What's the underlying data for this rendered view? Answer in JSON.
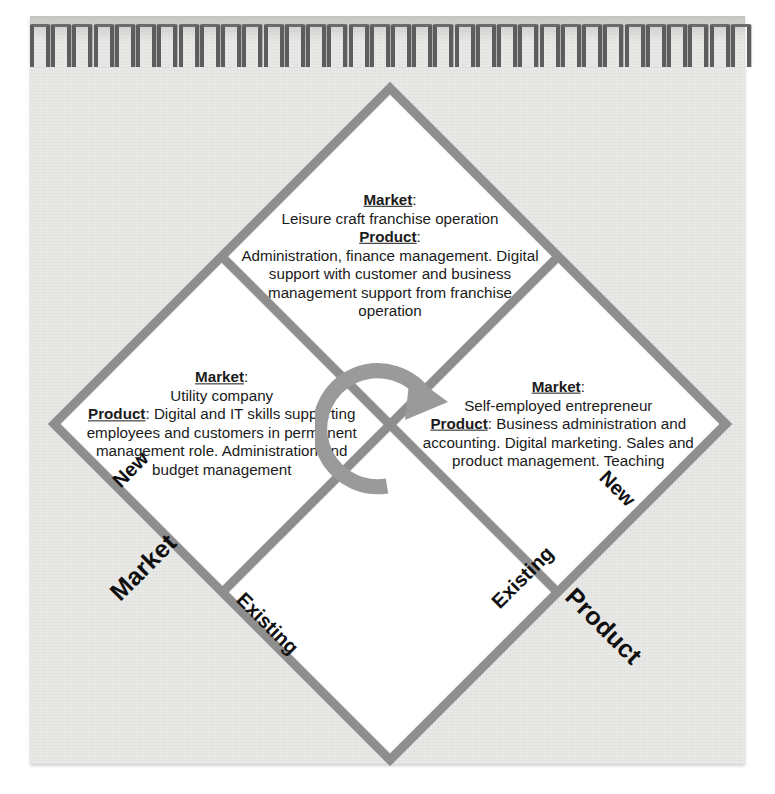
{
  "figure": {
    "type": "ansoff-matrix-diamond",
    "colors": {
      "band": "#8e8e8e",
      "cell": "#ffffff",
      "page": "#e9e9e7",
      "text": "#1b1b1b",
      "coil": "#5d5d5d"
    },
    "binding": {
      "coil_count": 34
    }
  },
  "labels": {
    "market_heading": "Market",
    "product_heading": "Product",
    "colon": ":"
  },
  "axes": {
    "left": {
      "name": "Market",
      "upper": "New",
      "lower": "Existing"
    },
    "right": {
      "name": "Product",
      "upper": "New",
      "lower": "Existing"
    }
  },
  "quadrants": {
    "top": {
      "position": "top",
      "market_label": "Market",
      "market_text": "Self-employed entrepreneur",
      "product_label": "Product",
      "product_text": "Business administration and accounting. Digital marketing. Sales and product management. Teaching"
    },
    "left": {
      "position": "left",
      "market_label": "Market",
      "market_text": "Leisure craft franchise operation",
      "product_label": "Product",
      "product_text": "Administration, finance management. Digital support with customer and business management support from franchise operation"
    },
    "bottom": {
      "position": "bottom",
      "market_label": "Market",
      "market_text": "Utility company",
      "product_label": "Product",
      "product_text": "Digital and IT skills supporting employees and customers in permanent management role. Administration and budget management"
    },
    "right": {
      "position": "right",
      "market_label": "",
      "market_text": "",
      "product_label": "",
      "product_text": ""
    }
  },
  "center": {
    "icon": "circular-rotation-arrow"
  }
}
